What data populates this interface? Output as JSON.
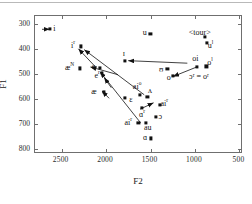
{
  "figure": {
    "xtitle": "F2",
    "ytitle": "F1"
  },
  "chart_data": {
    "type": "scatter",
    "title": "",
    "xlabel": "F2",
    "ylabel": "F1",
    "xlim": [
      2800,
      460
    ],
    "ylim": [
      820,
      270
    ],
    "x_ticks": [
      2500,
      2000,
      1500,
      1000,
      500
    ],
    "x_tick_labels": [
      "2500",
      "2000",
      "1500",
      "1000",
      "500"
    ],
    "y_ticks": [
      300,
      400,
      500,
      600,
      700,
      800
    ],
    "y_tick_labels": [
      "300",
      "400",
      "500",
      "600",
      "700",
      "800"
    ],
    "grid": false,
    "legend": null,
    "axis_note": "F2 decreases left-to-right; F1 increases top-to-bottom",
    "points": [
      {
        "label": "i",
        "sup": "",
        "F2": 2620,
        "F1": 327,
        "lx": 2570,
        "ly": 327
      },
      {
        "label": "i",
        "sup": "r",
        "F2": 2275,
        "F1": 395,
        "lx": 2360,
        "ly": 392
      },
      {
        "label": "æ",
        "sup": "N",
        "F2": 2280,
        "F1": 483,
        "lx": 2400,
        "ly": 480
      },
      {
        "label": "e",
        "sup": "",
        "F2": 2060,
        "F1": 480,
        "lx": 2130,
        "ly": 478
      },
      {
        "label": "e",
        "sup": "r",
        "F2": 2040,
        "F1": 500,
        "lx": 2090,
        "ly": 513
      },
      {
        "label": "æ",
        "sup": "",
        "F2": 2010,
        "F1": 578,
        "lx": 2125,
        "ly": 578
      },
      {
        "label": "ɛ",
        "sup": "",
        "F2": 1775,
        "F1": 602,
        "lx": 1710,
        "ly": 607
      },
      {
        "label": "ɪ",
        "sup": "",
        "F2": 1780,
        "F1": 452,
        "lx": 1790,
        "ly": 425
      },
      {
        "label": "u",
        "sup": "",
        "F2": 1490,
        "F1": 345,
        "lx": 1555,
        "ly": 343
      },
      {
        "label": "ai",
        "sup": "o",
        "F2": 1610,
        "F1": 588,
        "lx": 1640,
        "ly": 558
      },
      {
        "label": "ʌ",
        "sup": "",
        "F2": 1525,
        "F1": 597,
        "lx": 1495,
        "ly": 573
      },
      {
        "label": "ɑ",
        "sup": "r",
        "F2": 1590,
        "F1": 640,
        "lx": 1585,
        "ly": 668
      },
      {
        "label": "ɔ",
        "sup": "",
        "F2": 1430,
        "F1": 677,
        "lx": 1380,
        "ly": 676
      },
      {
        "label": "ai",
        "sup": "r",
        "F2": 1625,
        "F1": 700,
        "lx": 1740,
        "ly": 700
      },
      {
        "label": "ai",
        "sup": "r",
        "F2": 1380,
        "F1": 628,
        "lx": 1335,
        "ly": 626
      },
      {
        "label": "au",
        "sup": "",
        "F2": 1545,
        "F1": 700,
        "lx": 1520,
        "ly": 720
      },
      {
        "label": "ɑ",
        "sup": "",
        "F2": 1485,
        "F1": 762,
        "lx": 1550,
        "ly": 762
      },
      {
        "label": "ʊ",
        "sup": "",
        "F2": 1300,
        "F1": 484,
        "lx": 1370,
        "ly": 488
      },
      {
        "label": "o",
        "sup": "",
        "F2": 1235,
        "F1": 512,
        "lx": 1285,
        "ly": 522
      },
      {
        "label": "oi",
        "sup": "",
        "F2": 965,
        "F1": 476,
        "lx": 985,
        "ly": 447
      },
      {
        "label": "o",
        "sup": "l",
        "F2": 860,
        "F1": 475,
        "lx": 820,
        "ly": 462
      },
      {
        "label": "u",
        "sup": "l",
        "F2": 855,
        "F1": 382,
        "lx": 815,
        "ly": 392
      },
      {
        "label": "",
        "sup": "",
        "F2": 880,
        "F1": 357,
        "lx": 880,
        "ly": 357
      }
    ],
    "text_annotations": [
      {
        "text": "<tour>",
        "F2": 935,
        "F1": 340
      },
      {
        "text": "ɔʳ = oʳ",
        "F2": 945,
        "F1": 517
      }
    ],
    "arrows": [
      {
        "from": [
          2710,
          327
        ],
        "to": [
          2625,
          327
        ]
      },
      {
        "from": [
          1075,
          462
        ],
        "to": [
          1740,
          452
        ]
      },
      {
        "from": [
          1855,
          508
        ],
        "to": [
          2165,
          477
        ]
      },
      {
        "from": [
          2105,
          478
        ],
        "to": [
          2300,
          405
        ]
      },
      {
        "from": [
          1560,
          588
        ],
        "to": [
          2235,
          408
        ]
      },
      {
        "from": [
          1600,
          700
        ],
        "to": [
          2055,
          497
        ]
      },
      {
        "from": [
          1955,
          602
        ],
        "to": [
          2035,
          573
        ]
      },
      {
        "from": [
          1930,
          560
        ],
        "to": [
          2010,
          520
        ]
      },
      {
        "from": [
          975,
          478
        ],
        "to": [
          1235,
          515
        ]
      },
      {
        "from": [
          1605,
          645
        ],
        "to": [
          1455,
          620
        ]
      }
    ]
  }
}
